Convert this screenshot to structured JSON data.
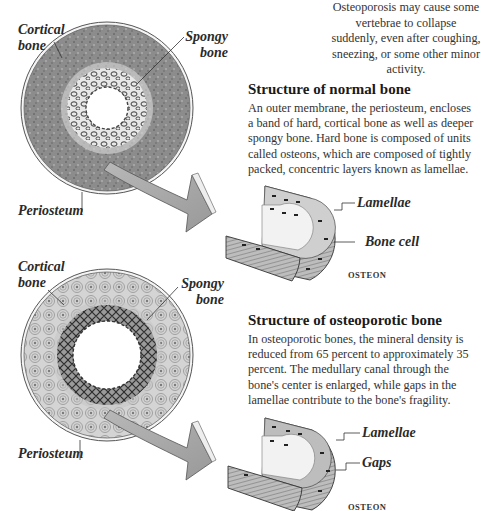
{
  "intro_text": "Osteoporosis may cause some vertebrae to collapse suddenly, even after coughing, sneezing, or some other minor activity.",
  "normal": {
    "heading": "Structure of normal bone",
    "paragraph": "An outer membrane, the periosteum, encloses a band of hard, cortical bone as well as deeper spongy bone. Hard bone is composed of units called osteons, which are composed of tightly packed, concentric layers known as lamellae.",
    "labels": {
      "cortical_line1": "Cortical",
      "cortical_line2": "bone",
      "spongy_line1": "Spongy",
      "spongy_line2": "bone",
      "periosteum": "Periosteum",
      "lamellae": "Lamellae",
      "bone_cell": "Bone cell",
      "osteon_caption": "OSTEON"
    }
  },
  "osteoporotic": {
    "heading": "Structure of osteoporotic bone",
    "paragraph": "In osteoporotic bones, the mineral density is reduced from 65 percent to approximately 35 percent. The medullary canal through the bone's center is enlarged, while gaps in the lamellae contribute to the bone's fragility.",
    "labels": {
      "cortical_line1": "Cortical",
      "cortical_line2": "bone",
      "spongy_line1": "Spongy",
      "spongy_line2": "bone",
      "periosteum": "Periosteum",
      "lamellae": "Lamellae",
      "gaps": "Gaps",
      "osteon_caption": "OSTEON"
    }
  },
  "colors": {
    "cortical_normal": "#8f8f8f",
    "cortical_porotic": "#c9c9c9",
    "spongy_band": "#6e6e6e",
    "arrow_fill": "#a9a9a9",
    "text": "#333333"
  }
}
